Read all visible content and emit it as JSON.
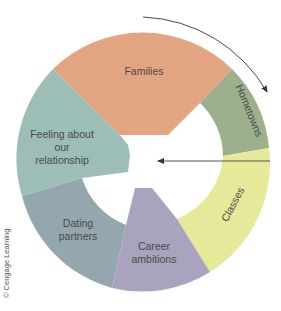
{
  "diagram": {
    "type": "ring-diagram",
    "segments": [
      {
        "id": "families",
        "label_lines": [
          "Families"
        ],
        "color": "#E3A581"
      },
      {
        "id": "hometowns",
        "label_lines": [
          "Hometowns"
        ],
        "color": "#9DB08E"
      },
      {
        "id": "classes",
        "label_lines": [
          "Classes"
        ],
        "color": "#E6E89A"
      },
      {
        "id": "career",
        "label_lines": [
          "Career",
          "ambitions"
        ],
        "color": "#A9A3BE"
      },
      {
        "id": "dating",
        "label_lines": [
          "Dating",
          "partners"
        ],
        "color": "#95A7AE"
      },
      {
        "id": "feeling",
        "label_lines": [
          "Feeling about",
          "our",
          "relationship"
        ],
        "color": "#9DBDB7"
      }
    ],
    "arrows": [
      {
        "id": "clockwise-arc-arrow",
        "description": "curved arrow above top-right of ring pointing clockwise"
      },
      {
        "id": "inward-arrow",
        "description": "horizontal arrow from right edge pointing left into center"
      }
    ],
    "credit": "© Cengage Learning"
  }
}
